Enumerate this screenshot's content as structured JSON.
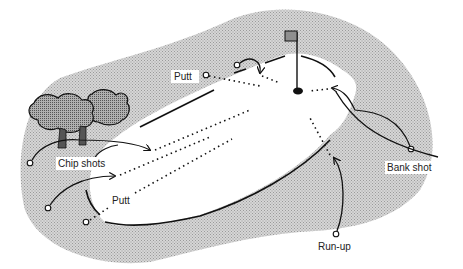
{
  "diagram": {
    "labels": {
      "putt_top": "Putt",
      "putt_bottom": "Putt",
      "chip_shots": "Chip shots",
      "bank_shot": "Bank shot",
      "run_up": "Run-up"
    },
    "colors": {
      "rough": "#c9c9c9",
      "green": "#ffffff",
      "tree": "#8a8a8a",
      "flag": "#8f8f8f",
      "ink": "#111111"
    },
    "elements": [
      "rough-area",
      "putting-green",
      "flag-pin",
      "hole",
      "trees",
      "ball-markers",
      "shot-paths"
    ]
  }
}
